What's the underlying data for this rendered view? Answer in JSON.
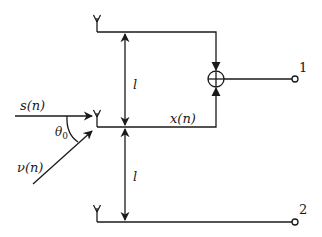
{
  "diagram": {
    "type": "antenna-array-signal-diagram",
    "colors": {
      "stroke": "#1a1a1a",
      "background": "#ffffff"
    },
    "labels": {
      "source_signal": "s(n)",
      "interference_signal": "ν(n)",
      "angle": "θ",
      "angle_subscript": "0",
      "middle_output": "x(n)",
      "spacing_top": "l",
      "spacing_bottom": "l",
      "output_1": "1",
      "output_2": "2"
    },
    "nodes": [
      {
        "id": "antenna-top",
        "kind": "antenna"
      },
      {
        "id": "antenna-middle",
        "kind": "antenna"
      },
      {
        "id": "antenna-bottom",
        "kind": "antenna"
      },
      {
        "id": "summing-junction",
        "kind": "adder"
      },
      {
        "id": "output-terminal-1",
        "kind": "terminal",
        "label": "1"
      },
      {
        "id": "output-terminal-2",
        "kind": "terminal",
        "label": "2"
      }
    ],
    "edges": [
      {
        "from": "antenna-top",
        "to": "summing-junction"
      },
      {
        "from": "antenna-middle",
        "to": "summing-junction",
        "label": "x(n)"
      },
      {
        "from": "summing-junction",
        "to": "output-terminal-1"
      },
      {
        "from": "antenna-bottom",
        "to": "output-terminal-2"
      }
    ]
  }
}
